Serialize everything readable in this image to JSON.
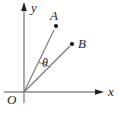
{
  "figure": {
    "colors": {
      "background": "#ffffff",
      "line_gray": "#7d7d7d",
      "ink_black": "#1f1f1f"
    },
    "labels": {
      "origin": "O",
      "x_axis": "x",
      "y_axis": "y",
      "point_a": "A",
      "point_b": "B",
      "angle": "θ"
    }
  }
}
